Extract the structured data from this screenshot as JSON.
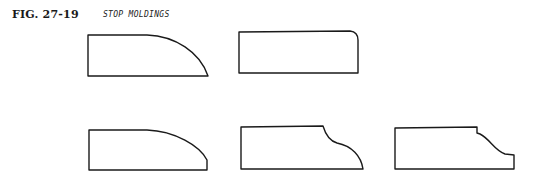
{
  "figure": {
    "label": "FIG. 27-19",
    "title": "STOP MOLDINGS"
  },
  "profiles": [
    {
      "name": "quarter-round-large-profile",
      "row": 1,
      "col": 1
    },
    {
      "name": "rounded-corner-profile",
      "row": 1,
      "col": 2
    },
    {
      "name": "elliptical-round-profile",
      "row": 2,
      "col": 1
    },
    {
      "name": "cove-and-round-profile",
      "row": 2,
      "col": 2
    },
    {
      "name": "ogee-profile",
      "row": 2,
      "col": 3
    }
  ]
}
